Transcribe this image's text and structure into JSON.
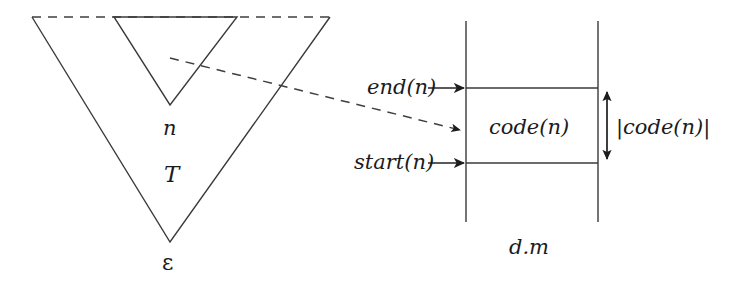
{
  "figure": {
    "title": "",
    "background_color": "#ffffff",
    "ink_color": "#1b1b1d"
  },
  "left_panel": {
    "outer_triangle": {
      "name": "derivation-tree-T",
      "label": "T",
      "apex_label": "ε",
      "top_edge_style": "dashed",
      "side_edge_style": "solid",
      "vertices": [
        [
          32,
          17
        ],
        [
          330,
          17
        ],
        [
          170,
          242
        ]
      ]
    },
    "inner_triangle": {
      "name": "subtree-n",
      "label": "n",
      "top_edge_style": "solid",
      "side_edge_style": "solid",
      "vertices": [
        [
          114,
          17
        ],
        [
          237,
          17
        ],
        [
          170,
          105
        ]
      ]
    },
    "labels": {
      "subtree_root": "n",
      "tree": "T",
      "root_epsilon": "ε"
    }
  },
  "connector_lines": [
    {
      "name": "upper-dashed-connector",
      "style": "dashed",
      "from": [
        32,
        17
      ],
      "to": [
        330,
        17
      ]
    },
    {
      "name": "subtree-to-code-connector",
      "style": "dashed",
      "from": [
        170,
        58
      ],
      "to": [
        466,
        131
      ],
      "arrowhead": true
    }
  ],
  "right_panel": {
    "name": "memory-segment-d-m",
    "caption": "d.m",
    "left_boundary_x": 466,
    "right_boundary_x": 598,
    "boundary_top_y": 21,
    "boundary_bottom_y": 222,
    "code_block": {
      "label": "code(n)",
      "top_y": 88,
      "bottom_y": 163
    },
    "pointers": [
      {
        "name": "end-pointer",
        "label": "end(n)",
        "y": 88
      },
      {
        "name": "start-pointer",
        "label": "start(n)",
        "y": 163
      }
    ],
    "size_measure": {
      "name": "code-length-measure",
      "label": "|code(n)|",
      "x": 607,
      "top_y": 88,
      "bottom_y": 163
    }
  }
}
